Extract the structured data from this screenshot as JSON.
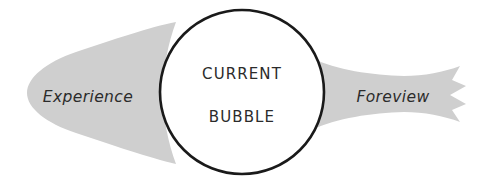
{
  "diagram": {
    "title": "Current Bubble",
    "background_color": "#ffffff",
    "shape_fill_color": "#cfcfcf",
    "outline_color": "#1a1a1a",
    "text_color": "#2b2b2b",
    "bubble": {
      "label_line1": "CURRENT",
      "label_line2": "BUBBLE",
      "center_x": 242,
      "center_y": 92,
      "radius": 83,
      "stroke_width": 2.6
    },
    "left_region": {
      "label": "Experience",
      "label_x": 88,
      "label_y": 96,
      "tip_x": 27,
      "shape_type": "teardrop-cone"
    },
    "right_region": {
      "label": "Foreview",
      "label_x": 393,
      "label_y": 96,
      "edge_x": 466,
      "shape_type": "horn-torn-edge",
      "torn_points": 3
    }
  }
}
